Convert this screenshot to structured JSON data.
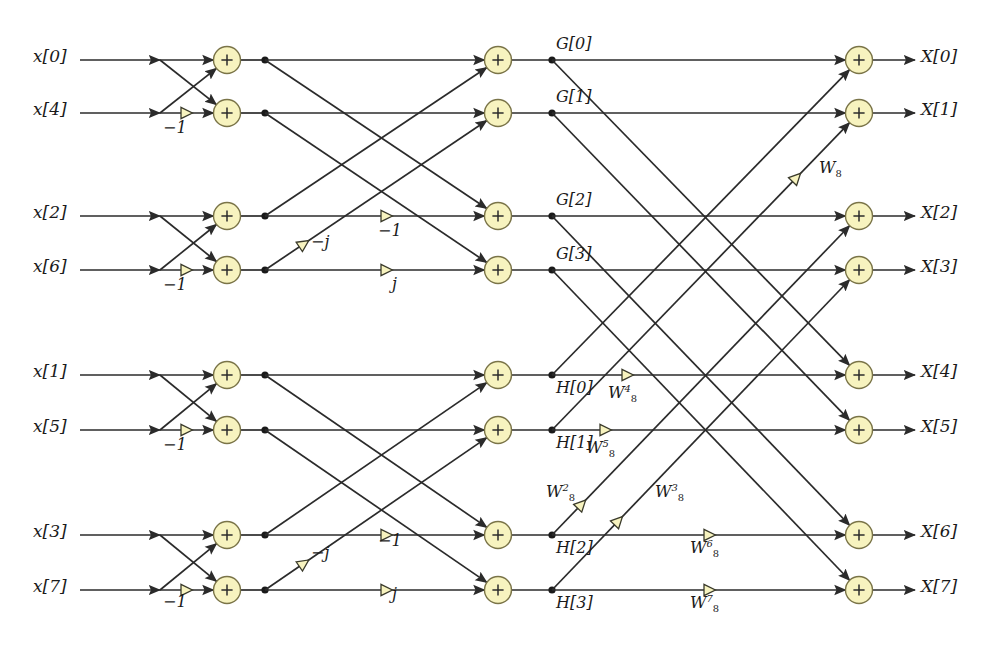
{
  "figure": {
    "type": "diagram",
    "colors": {
      "node_fill": "#f7f3bf",
      "node_stroke": "#7a7448",
      "line": "#2b2b2b",
      "background": "#ffffff"
    }
  },
  "inputs": [
    {
      "label": "x[0]",
      "row": 0
    },
    {
      "label": "x[4]",
      "row": 1
    },
    {
      "label": "x[2]",
      "row": 2
    },
    {
      "label": "x[6]",
      "row": 3
    },
    {
      "label": "x[1]",
      "row": 4
    },
    {
      "label": "x[5]",
      "row": 5
    },
    {
      "label": "x[3]",
      "row": 6
    },
    {
      "label": "x[7]",
      "row": 7
    }
  ],
  "outputs": [
    {
      "label": "X[0]",
      "row": 0
    },
    {
      "label": "X[1]",
      "row": 1
    },
    {
      "label": "X[2]",
      "row": 2
    },
    {
      "label": "X[3]",
      "row": 3
    },
    {
      "label": "X[4]",
      "row": 4
    },
    {
      "label": "X[5]",
      "row": 5
    },
    {
      "label": "X[6]",
      "row": 6
    },
    {
      "label": "X[7]",
      "row": 7
    }
  ],
  "intermediate_labels": [
    {
      "label": "G[0]",
      "row": 0,
      "place": "above"
    },
    {
      "label": "G[1]",
      "row": 1,
      "place": "above"
    },
    {
      "label": "G[2]",
      "row": 2,
      "place": "above"
    },
    {
      "label": "G[3]",
      "row": 3,
      "place": "above"
    },
    {
      "label": "H[0]",
      "row": 4,
      "place": "below"
    },
    {
      "label": "H[1]",
      "row": 5,
      "place": "below"
    },
    {
      "label": "H[2]",
      "row": 6,
      "place": "below"
    },
    {
      "label": "H[3]",
      "row": 7,
      "place": "below"
    }
  ],
  "stage1_multipliers": [
    {
      "text": "−1",
      "row": 1
    },
    {
      "text": "−1",
      "row": 3
    },
    {
      "text": "−1",
      "row": 5
    },
    {
      "text": "−1",
      "row": 7
    }
  ],
  "stage2_multipliers": [
    {
      "text": "−1",
      "row": 2,
      "kind": "horizontal"
    },
    {
      "text": "j",
      "row": 3,
      "kind": "horizontal"
    },
    {
      "text": "−j",
      "row": 3,
      "kind": "diagonal-down"
    },
    {
      "text": "−1",
      "row": 6,
      "kind": "horizontal"
    },
    {
      "text": "j",
      "row": 7,
      "kind": "horizontal"
    },
    {
      "text": "−j",
      "row": 7,
      "kind": "diagonal-down"
    }
  ],
  "stage3_multipliers": [
    {
      "base": "W",
      "sub": "8",
      "sup": "",
      "row": 5,
      "kind": "diagonal-up"
    },
    {
      "base": "W",
      "sub": "8",
      "sup": "4",
      "row": 4,
      "kind": "horizontal"
    },
    {
      "base": "W",
      "sub": "8",
      "sup": "5",
      "row": 5,
      "kind": "horizontal"
    },
    {
      "base": "W",
      "sub": "8",
      "sup": "2",
      "row": 6,
      "kind": "diagonal-up"
    },
    {
      "base": "W",
      "sub": "8",
      "sup": "3",
      "row": 7,
      "kind": "diagonal-up"
    },
    {
      "base": "W",
      "sub": "8",
      "sup": "6",
      "row": 6,
      "kind": "horizontal"
    },
    {
      "base": "W",
      "sub": "8",
      "sup": "7",
      "row": 7,
      "kind": "horizontal"
    }
  ],
  "adders": {
    "symbol": "+",
    "stage1_count": 4,
    "stage2_count": 4,
    "stage3_count": 8,
    "total": 16
  },
  "stages": [
    {
      "name": "stage-1",
      "description": "2-point DFT butterflies"
    },
    {
      "name": "stage-2",
      "description": "4-point DFT combination"
    },
    {
      "name": "stage-3",
      "description": "8-point DFT combination"
    }
  ]
}
